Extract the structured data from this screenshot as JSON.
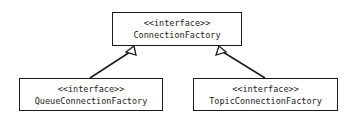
{
  "diagram": {
    "type": "uml-class-diagram",
    "colors": {
      "line": "#1a1a1a",
      "background": "#ffffff"
    },
    "nodes": [
      {
        "id": "connection_factory",
        "stereotype": "<<interface>>",
        "name": "ConnectionFactory"
      },
      {
        "id": "queue_connection_factory",
        "stereotype": "<<interface>>",
        "name": "QueueConnectionFactory"
      },
      {
        "id": "topic_connection_factory",
        "stereotype": "<<interface>>",
        "name": "TopicConnectionFactory"
      }
    ],
    "edges": [
      {
        "from": "queue_connection_factory",
        "to": "connection_factory",
        "kind": "generalization"
      },
      {
        "from": "topic_connection_factory",
        "to": "connection_factory",
        "kind": "generalization"
      }
    ]
  }
}
